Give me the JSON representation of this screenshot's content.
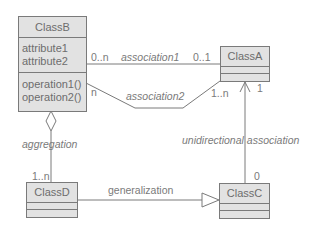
{
  "classes": {
    "classB": {
      "name": "ClassB",
      "attributes": [
        "attribute1",
        "attribute2"
      ],
      "operations": [
        "operation1()",
        "operation2()"
      ]
    },
    "classA": {
      "name": "ClassA"
    },
    "classC": {
      "name": "ClassC"
    },
    "classD": {
      "name": "ClassD"
    }
  },
  "relations": {
    "association1": {
      "label": "association1",
      "source_mult": "0..n",
      "target_mult": "0..1"
    },
    "association2": {
      "label": "association2",
      "source_mult": "n",
      "target_mult": "1..n"
    },
    "aggregation": {
      "label": "aggregation",
      "target_mult": "1..n"
    },
    "unidirectional": {
      "label": "unidirectional association",
      "target_mult": "1",
      "source_mult": "0"
    },
    "generalization": {
      "label": "generalization"
    }
  },
  "colors": {
    "line": "#7a7a7a",
    "box_fill": "#e2e2e2",
    "text": "#6d6d6d"
  }
}
